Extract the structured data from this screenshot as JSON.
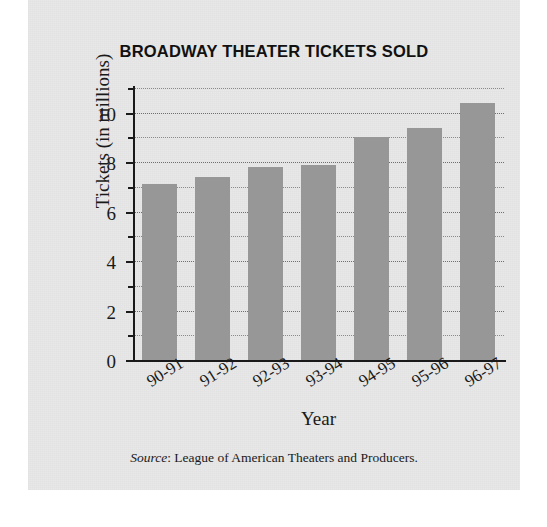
{
  "chart_data": {
    "type": "bar",
    "title": "BROADWAY THEATER TICKETS SOLD",
    "xlabel": "Year",
    "ylabel": "Tickets (in millions)",
    "categories": [
      "90-91",
      "91-92",
      "92-93",
      "93-94",
      "94-95",
      "95-96",
      "96-97"
    ],
    "values": [
      7.1,
      7.4,
      7.8,
      7.9,
      9.0,
      9.4,
      10.4
    ],
    "ylim": [
      0,
      11
    ],
    "ytick_major": [
      0,
      2,
      4,
      6,
      8,
      10
    ],
    "ytick_major_labels": [
      "0",
      "2",
      "4",
      "6",
      "8",
      "10"
    ],
    "ytick_minor": [
      1,
      3,
      5,
      7,
      9,
      11
    ],
    "gridlines": [
      1,
      2,
      3,
      4,
      5,
      6,
      7,
      8,
      9,
      10,
      11
    ],
    "grid": true,
    "legend": "none",
    "bar_color": "#979797",
    "axis_color": "#1a1a1a",
    "background_color": "#e8e8e8",
    "source_label": "Source",
    "source_text": ": League of American Theaters and Producers."
  }
}
